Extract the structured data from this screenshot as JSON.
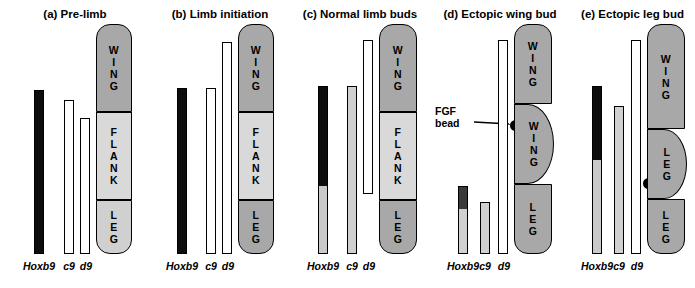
{
  "figure": {
    "title_font_note": "",
    "colors": {
      "black_bar": "#0d0d0d",
      "light_gray": "#d0d0d0",
      "mid_gray": "#a8a8a8",
      "dark_gray": "#8d8d8d",
      "white": "#ffffff",
      "outline": "#000000"
    }
  },
  "panels": [
    {
      "id": "a",
      "label": "(a)  Pre-limb",
      "axis_labels": [
        "Hoxb9",
        "c9",
        "d9"
      ],
      "fields": [
        {
          "name": "WING",
          "text": "W\nI\nN\nG",
          "shade": "mid_gray"
        },
        {
          "name": "FLANK",
          "text": "F\nL\nA\nN\nK",
          "shade": "light_gray"
        },
        {
          "name": "LEG",
          "text": "L\nE\nG",
          "shade": "mid_gray"
        }
      ],
      "bars": [
        {
          "gene": "Hoxb9",
          "fill": "black_bar"
        },
        {
          "gene": "c9",
          "fill": "white"
        },
        {
          "gene": "d9",
          "fill": "white"
        }
      ]
    },
    {
      "id": "b",
      "label": "(b)  Limb initiation",
      "axis_labels": [
        "Hoxb9",
        "c9",
        "d9"
      ],
      "fields": [
        {
          "name": "WING",
          "text": "W\nI\nN\nG",
          "shade": "mid_gray"
        },
        {
          "name": "FLANK",
          "text": "F\nL\nA\nN\nK",
          "shade": "light_gray"
        },
        {
          "name": "LEG",
          "text": "L\nE\nG",
          "shade": "mid_gray"
        }
      ],
      "bars": [
        {
          "gene": "Hoxb9",
          "fill": "black_bar"
        },
        {
          "gene": "c9",
          "fill": "white"
        },
        {
          "gene": "d9",
          "fill": "white"
        }
      ]
    },
    {
      "id": "c",
      "label": "(c)  Normal limb buds",
      "axis_labels": [
        "Hoxb9",
        "c9",
        "d9"
      ],
      "fields": [
        {
          "name": "WING",
          "text": "W\nI\nN\nG",
          "shade": "mid_gray"
        },
        {
          "name": "FLANK",
          "text": "F\nL\nA\nN\nK",
          "shade": "light_gray"
        },
        {
          "name": "LEG",
          "text": "L\nE\nG",
          "shade": "mid_gray"
        }
      ],
      "bars": [
        {
          "gene": "Hoxb9",
          "fill": "black_bar"
        },
        {
          "gene": "c9",
          "fill": "light_gray"
        },
        {
          "gene": "d9",
          "fill": "white"
        }
      ]
    },
    {
      "id": "d",
      "label": "(d)  Ectopic wing bud",
      "axis_labels": [
        "Hoxb9",
        "c9",
        "d9"
      ],
      "annotation": "FGF\nbead",
      "fields": [
        {
          "name": "WING",
          "text": "W\nI\nN\nG",
          "shade": "mid_gray"
        },
        {
          "name": "WING",
          "text": "W\nI\nN\nG",
          "shade": "mid_gray"
        },
        {
          "name": "LEG",
          "text": "L\nE\nG",
          "shade": "mid_gray"
        }
      ],
      "bars": [
        {
          "gene": "Hoxb9",
          "fill": "black_bar"
        },
        {
          "gene": "c9",
          "fill": "light_gray"
        },
        {
          "gene": "d9",
          "fill": "white"
        }
      ]
    },
    {
      "id": "e",
      "label": "(e)  Ectopic leg bud",
      "axis_labels": [
        "Hoxb9",
        "c9",
        "d9"
      ],
      "fields": [
        {
          "name": "WING",
          "text": "W\nI\nN\nG",
          "shade": "mid_gray"
        },
        {
          "name": "LEG",
          "text": "L\nE\nG",
          "shade": "mid_gray"
        },
        {
          "name": "LEG",
          "text": "L\nE\nG",
          "shade": "mid_gray"
        }
      ],
      "bars": [
        {
          "gene": "Hoxb9",
          "fill": "black_bar"
        },
        {
          "gene": "c9",
          "fill": "light_gray"
        },
        {
          "gene": "d9",
          "fill": "white"
        }
      ]
    }
  ]
}
